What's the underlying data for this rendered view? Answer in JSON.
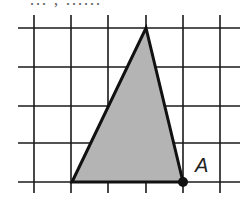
{
  "caption_fragment": "... , ......",
  "grid": {
    "vertical_x": [
      34,
      71,
      108,
      146,
      183,
      220
    ],
    "horizontal_y": [
      28,
      67,
      106,
      143,
      182
    ],
    "x_extent": [
      18,
      240
    ],
    "y_extent": [
      15,
      193
    ],
    "line_color": "#1a1a1a"
  },
  "triangle": {
    "vertices": [
      [
        72,
        182
      ],
      [
        146,
        28
      ],
      [
        183,
        182
      ]
    ],
    "fill": "#b4b4b4",
    "stroke": "#111111"
  },
  "point": {
    "label": "A",
    "x": 183,
    "y": 182
  }
}
